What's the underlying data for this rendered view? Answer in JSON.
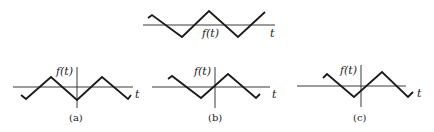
{
  "figures": {
    "top": {
      "function_label": "f(t)",
      "axis_label": "t",
      "waveform": "triangle wave, no vertical axis shown"
    },
    "a": {
      "caption": "(a)",
      "function_label": "f(t)",
      "axis_label": "t",
      "waveform": "triangle wave, trough at origin (even)"
    },
    "b": {
      "caption": "(b)",
      "function_label": "f(t)",
      "axis_label": "t",
      "waveform": "triangle wave, zero crossing at origin (odd)"
    },
    "c": {
      "caption": "(c)",
      "function_label": "f(t)",
      "axis_label": "t",
      "waveform": "triangle wave, shifted, neither even nor odd"
    }
  },
  "colors": {
    "line": "#1a1a1a",
    "axis": "#3a3a3a",
    "background": "#ffffff"
  }
}
